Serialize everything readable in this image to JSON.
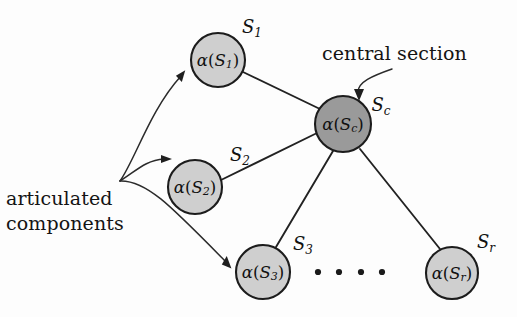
{
  "figure": {
    "background_color": "#fdfdfd",
    "width": 517,
    "height": 317
  },
  "annotations": {
    "central_section": "central section",
    "articulated_components_line1": "articulated",
    "articulated_components_line2": "components"
  },
  "colors": {
    "central_node_fill": "#9a9a9a",
    "outer_node_fill": "#cfcfcf",
    "node_stroke": "#1c1c1c",
    "edge_stroke": "#222222",
    "text": "#141414"
  },
  "nodes": [
    {
      "id": "S1",
      "inner_alpha": "α",
      "inner_open": "(",
      "inner_base": "S",
      "inner_sub": "1",
      "inner_close": ")",
      "side_base": "S",
      "side_sub": "1",
      "side_label_x": 252,
      "side_label_y": 28,
      "cx": 218,
      "cy": 60,
      "r": 27,
      "fill": "#cfcfcf",
      "role": "articulated-component"
    },
    {
      "id": "S2",
      "inner_alpha": "α",
      "inner_open": "(",
      "inner_base": "S",
      "inner_sub": "2",
      "inner_close": ")",
      "side_base": "S",
      "side_sub": "2",
      "side_label_x": 240,
      "side_label_y": 156,
      "cx": 195,
      "cy": 187,
      "r": 27,
      "fill": "#cfcfcf",
      "role": "articulated-component"
    },
    {
      "id": "Sc",
      "inner_alpha": "α",
      "inner_open": "(",
      "inner_base": "S",
      "inner_sub": "c",
      "inner_close": ")",
      "side_base": "S",
      "side_sub": "c",
      "side_label_x": 381,
      "side_label_y": 106,
      "cx": 343,
      "cy": 124,
      "r": 28,
      "fill": "#9a9a9a",
      "role": "central-section"
    },
    {
      "id": "S3",
      "inner_alpha": "α",
      "inner_open": "(",
      "inner_base": "S",
      "inner_sub": "3",
      "inner_close": ")",
      "side_base": "S",
      "side_sub": "3",
      "side_label_x": 303,
      "side_label_y": 245,
      "cx": 263,
      "cy": 272,
      "r": 27,
      "fill": "#cfcfcf",
      "role": "articulated-component"
    },
    {
      "id": "Sr",
      "inner_alpha": "α",
      "inner_open": "(",
      "inner_base": "S",
      "inner_sub": "r",
      "inner_close": ")",
      "side_base": "S",
      "side_sub": "r",
      "side_label_x": 486,
      "side_label_y": 243,
      "cx": 452,
      "cy": 273,
      "r": 26,
      "fill": "#cfcfcf",
      "role": "articulated-component"
    }
  ],
  "edges": [
    {
      "from": "Sc",
      "to": "S1",
      "x1": 320,
      "y1": 109,
      "x2": 243,
      "y2": 72
    },
    {
      "from": "Sc",
      "to": "S2",
      "x1": 317,
      "y1": 133,
      "x2": 221,
      "y2": 180
    },
    {
      "from": "Sc",
      "to": "S3",
      "x1": 333,
      "y1": 151,
      "x2": 276,
      "y2": 247
    },
    {
      "from": "Sc",
      "to": "Sr",
      "x1": 360,
      "y1": 149,
      "x2": 440,
      "y2": 249
    }
  ],
  "ellipsis_dots": [
    {
      "cx": 318,
      "cy": 272,
      "r": 3.1
    },
    {
      "cx": 339,
      "cy": 272,
      "r": 3.1
    },
    {
      "cx": 361,
      "cy": 272,
      "r": 3.1
    },
    {
      "cx": 382,
      "cy": 272,
      "r": 3.1
    }
  ],
  "annotation_arrows": [
    {
      "name": "arrow-to-S1",
      "path": "M 120 181 C 135 160, 150 110, 181 76",
      "tip_x": 186,
      "tip_y": 71,
      "angle": -47
    },
    {
      "name": "arrow-to-S2",
      "path": "M 120 181 C 136 171, 146 160, 164 159",
      "tip_x": 171,
      "tip_y": 159,
      "angle": -4
    },
    {
      "name": "arrow-to-S3",
      "path": "M 120 181 C 146 180, 170 205, 226 262",
      "tip_x": 232,
      "tip_y": 268,
      "angle": 45
    },
    {
      "name": "arrow-to-central-section",
      "path": "M 392 69 C 372 76, 358 82, 358 92",
      "tip_x": 359,
      "tip_y": 100,
      "angle": 97
    }
  ]
}
